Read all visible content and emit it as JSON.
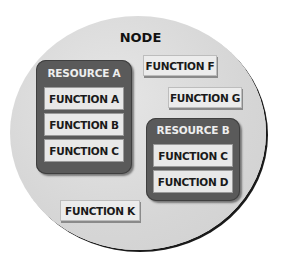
{
  "diagram": {
    "node": {
      "label": "NODE"
    },
    "resources": [
      {
        "label": "RESOURCE A",
        "functions": [
          "FUNCTION A",
          "FUNCTION B",
          "FUNCTION C"
        ]
      },
      {
        "label": "RESOURCE B",
        "functions": [
          "FUNCTION C",
          "FUNCTION D"
        ]
      }
    ],
    "free_functions": [
      "FUNCTION F",
      "FUNCTION G",
      "FUNCTION K"
    ]
  }
}
